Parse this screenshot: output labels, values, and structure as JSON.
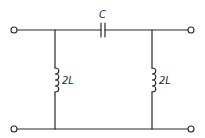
{
  "diagram": {
    "type": "circuit",
    "components": [
      {
        "id": "C1",
        "kind": "capacitor",
        "label": "C",
        "placement": "series, top rail"
      },
      {
        "id": "L1",
        "kind": "inductor",
        "label": "2L",
        "placement": "shunt, left"
      },
      {
        "id": "L2",
        "kind": "inductor",
        "label": "2L",
        "placement": "shunt, right"
      }
    ],
    "terminals": [
      {
        "id": "in-top",
        "position": "top-left"
      },
      {
        "id": "in-bottom",
        "position": "bottom-left"
      },
      {
        "id": "out-top",
        "position": "top-right"
      },
      {
        "id": "out-bottom",
        "position": "bottom-right"
      }
    ]
  },
  "labels": {
    "capacitor": "C",
    "inductor_left": "2L",
    "inductor_right": "2L"
  },
  "colors": {
    "line": "#2a2a2a",
    "background": "#ffffff"
  }
}
